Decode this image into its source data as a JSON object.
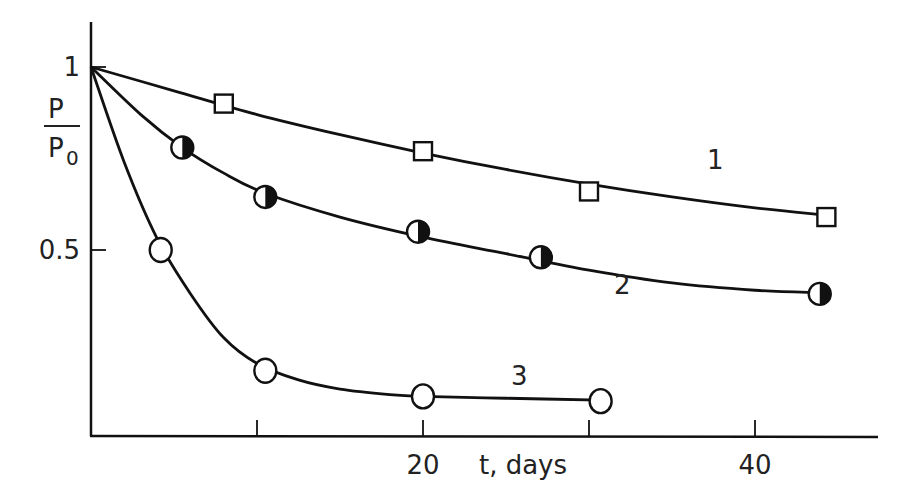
{
  "chart_data": {
    "type": "scatter",
    "title": "",
    "xlabel": "t, days",
    "ylabel_top": "P",
    "ylabel_bottom": "P",
    "ylabel_subscript": "0",
    "xlim": [
      0,
      47
    ],
    "ylim": [
      0,
      1.12
    ],
    "x_ticks": [
      10,
      20,
      30,
      40
    ],
    "x_tick_labels": [
      {
        "value": 20,
        "text": "20"
      },
      {
        "value": 40,
        "text": "40"
      }
    ],
    "y_ticks": [
      0.5,
      1
    ],
    "y_tick_labels": [
      {
        "value": 1,
        "text": "1"
      },
      {
        "value": 0.5,
        "text": "0.5"
      }
    ],
    "grid": false,
    "legend": "none",
    "series": [
      {
        "name": "1",
        "marker": "open-square",
        "points": [
          [
            8,
            0.9
          ],
          [
            20,
            0.77
          ],
          [
            30,
            0.66
          ],
          [
            44.3,
            0.59
          ]
        ],
        "curve": [
          [
            0,
            1.0
          ],
          [
            5,
            0.935
          ],
          [
            10,
            0.87
          ],
          [
            15,
            0.815
          ],
          [
            20,
            0.765
          ],
          [
            25,
            0.72
          ],
          [
            30,
            0.68
          ],
          [
            35,
            0.645
          ],
          [
            40,
            0.615
          ],
          [
            44.3,
            0.595
          ]
        ],
        "label_pos": [
          37.6,
          0.72
        ]
      },
      {
        "name": "2",
        "marker": "half-filled-circle",
        "points": [
          [
            5.5,
            0.78
          ],
          [
            10.5,
            0.645
          ],
          [
            19.7,
            0.55
          ],
          [
            27.1,
            0.48
          ],
          [
            43.9,
            0.38
          ]
        ],
        "curve": [
          [
            0,
            1.0
          ],
          [
            3,
            0.87
          ],
          [
            5.5,
            0.78
          ],
          [
            8,
            0.71
          ],
          [
            10.5,
            0.655
          ],
          [
            15,
            0.59
          ],
          [
            20,
            0.535
          ],
          [
            25,
            0.49
          ],
          [
            30,
            0.445
          ],
          [
            35,
            0.41
          ],
          [
            40,
            0.39
          ],
          [
            43.9,
            0.383
          ]
        ],
        "label_pos": [
          32,
          0.38
        ]
      },
      {
        "name": "3",
        "marker": "open-circle",
        "points": [
          [
            4.2,
            0.5
          ],
          [
            10.5,
            0.17
          ],
          [
            20,
            0.1
          ],
          [
            30.7,
            0.087
          ]
        ],
        "curve": [
          [
            0,
            1.0
          ],
          [
            2,
            0.74
          ],
          [
            4,
            0.53
          ],
          [
            6,
            0.38
          ],
          [
            8,
            0.26
          ],
          [
            10,
            0.19
          ],
          [
            12.5,
            0.145
          ],
          [
            15,
            0.12
          ],
          [
            18,
            0.105
          ],
          [
            20,
            0.1
          ],
          [
            25,
            0.095
          ],
          [
            30.7,
            0.09
          ]
        ],
        "label_pos": [
          25.8,
          0.13
        ]
      }
    ]
  }
}
